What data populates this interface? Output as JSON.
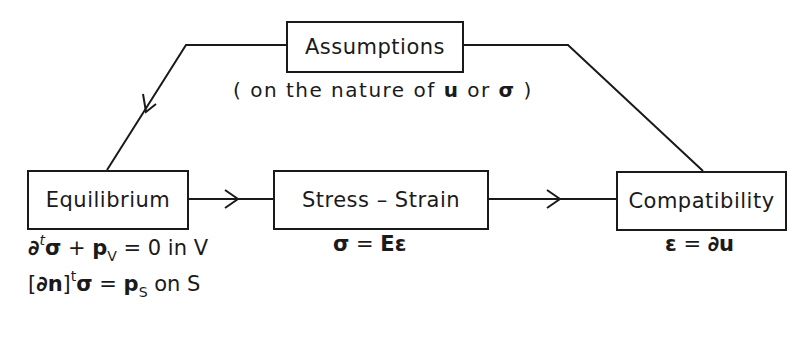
{
  "diagram": {
    "type": "flow",
    "colors": {
      "line": "#1a1a1a",
      "background": "#ffffff"
    },
    "nodes": {
      "assumptions": {
        "label": "Assumptions",
        "note": {
          "prefix": "( on the nature of ",
          "u": "u",
          "or": " or ",
          "sigma": "σ",
          "suffix": " )"
        }
      },
      "equilibrium": {
        "label": "Equilibrium"
      },
      "stress_strain": {
        "label": "Stress – Strain"
      },
      "compatibility": {
        "label": "Compatibility"
      }
    },
    "edges": [
      {
        "from": "assumptions",
        "to": "equilibrium",
        "arrow": true
      },
      {
        "from": "assumptions",
        "to": "compatibility",
        "arrow": false
      },
      {
        "from": "equilibrium",
        "to": "stress_strain",
        "arrow": true
      },
      {
        "from": "stress_strain",
        "to": "compatibility",
        "arrow": true
      }
    ],
    "equations": {
      "equilibrium_line1": {
        "d": "∂",
        "t": "t",
        "sigma": "σ",
        "plus": " + ",
        "p": "p",
        "sub": "V",
        "rest": " = 0  in V"
      },
      "equilibrium_line2": {
        "open": "[",
        "dn": "∂n",
        "close": "]",
        "t": "t",
        "sigma": "σ",
        "eq": " = ",
        "p": "p",
        "sub": "S",
        "rest": " on S"
      },
      "stress_strain": {
        "sigma": "σ",
        "eq": " = ",
        "rhs": "Eε"
      },
      "compatibility": {
        "eps": "ε",
        "eq": " = ",
        "rhs": "∂u"
      }
    }
  }
}
